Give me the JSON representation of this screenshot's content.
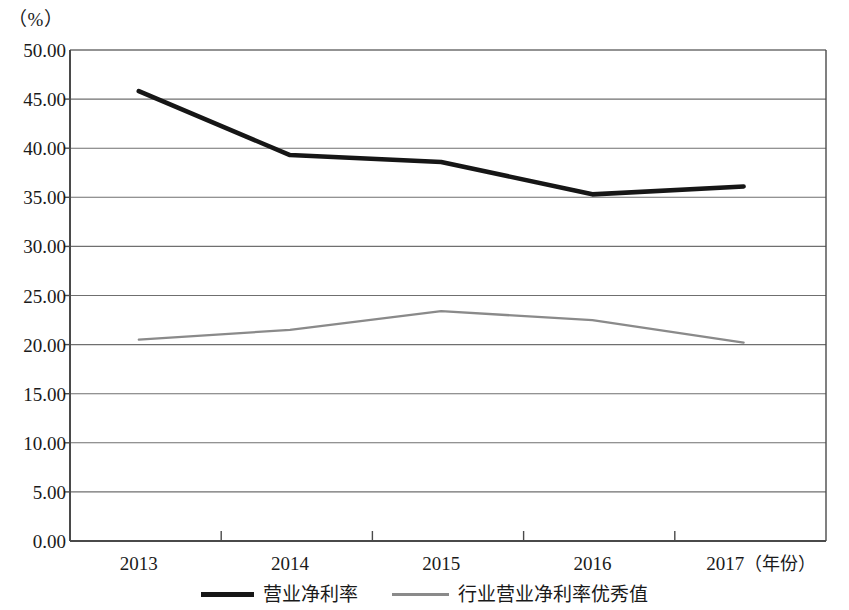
{
  "unit_label": "（%）",
  "legend": {
    "items": [
      {
        "label": "营业净利率",
        "swatch": "thick-dark-line-swatch",
        "color": "#161616"
      },
      {
        "label": "行业营业净利率优秀值",
        "swatch": "thin-gray-line-swatch",
        "color": "#8a8a8a"
      }
    ]
  },
  "axis": {
    "x_unit": "（年份）",
    "y_tick_labels": [
      "0.00",
      "5.00",
      "10.00",
      "15.00",
      "20.00",
      "25.00",
      "30.00",
      "35.00",
      "40.00",
      "45.00",
      "50.00"
    ],
    "x_tick_labels": [
      "2013",
      "2014",
      "2015",
      "2016",
      "2017"
    ]
  },
  "chart_data": {
    "type": "line",
    "title": "",
    "xlabel": "（年份）",
    "ylabel": "（%）",
    "ylim": [
      0,
      50
    ],
    "yticks": [
      0,
      5,
      10,
      15,
      20,
      25,
      30,
      35,
      40,
      45,
      50
    ],
    "grid": true,
    "legend_position": "bottom",
    "categories": [
      "2013",
      "2014",
      "2015",
      "2016",
      "2017"
    ],
    "series": [
      {
        "name": "营业净利率",
        "color": "#161616",
        "style": "solid-thick",
        "values": [
          45.8,
          39.3,
          38.6,
          35.3,
          36.1
        ]
      },
      {
        "name": "行业营业净利率优秀值",
        "color": "#8a8a8a",
        "style": "solid-thin",
        "values": [
          20.5,
          21.5,
          23.4,
          22.5,
          20.2
        ]
      }
    ]
  }
}
